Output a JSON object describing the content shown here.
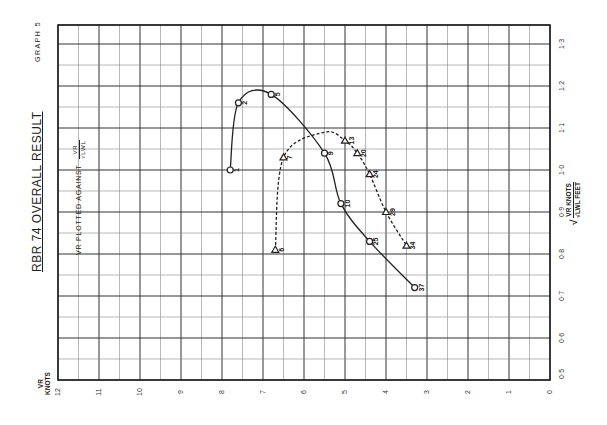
{
  "header": {
    "graph_number": "GRAPH 5",
    "title": "RBR 74  OVERALL RESULT",
    "subtitle_prefix": "VR PLOTTED AGAINST",
    "subtitle_fraction_num": "VR",
    "subtitle_fraction_den": "√LWL"
  },
  "axes": {
    "knots_label_line1": "VR",
    "knots_label_line2": "KNOTS",
    "knots_ticks": [
      "12",
      "11",
      "10",
      "9",
      "8",
      "7",
      "6",
      "5",
      "4",
      "3",
      "2",
      "1",
      "0"
    ],
    "ratio_ticks": [
      "0·5",
      "0·6",
      "0·7",
      "0·8",
      "0·9",
      "1·0",
      "1·1",
      "1·2",
      "1·3"
    ],
    "ratio_label_num": "VR KNOTS",
    "ratio_label_den": "√LWL FEET"
  },
  "chart_data": {
    "type": "line",
    "title": "RBR 74 OVERALL RESULT",
    "subtitle": "VR plotted against VR/√LWL",
    "orientation": "page rotated 90° counter-clockwise",
    "xlabel": "VR KNOTS",
    "ylabel": "VR KNOTS / √LWL FEET",
    "xlim": [
      0,
      12
    ],
    "ylim": [
      0.5,
      1.35
    ],
    "x_ticks": [
      12,
      11,
      10,
      9,
      8,
      7,
      6,
      5,
      4,
      3,
      2,
      1,
      0
    ],
    "y_ticks": [
      0.5,
      0.6,
      0.7,
      0.8,
      0.9,
      1.0,
      1.1,
      1.2,
      1.3
    ],
    "grid": true,
    "series": [
      {
        "name": "Series A (solid, circle markers)",
        "style": "solid",
        "marker": "circle",
        "points": [
          {
            "label": "1",
            "x": 7.8,
            "y": 1.0
          },
          {
            "label": "2",
            "x": 7.6,
            "y": 1.16
          },
          {
            "label": "5",
            "x": 6.8,
            "y": 1.18
          },
          {
            "label": "9",
            "x": 5.5,
            "y": 1.04
          },
          {
            "label": "10",
            "x": 5.1,
            "y": 0.92
          },
          {
            "label": "25",
            "x": 4.4,
            "y": 0.83
          },
          {
            "label": "37",
            "x": 3.3,
            "y": 0.72
          }
        ]
      },
      {
        "name": "Series B (dashed, triangle markers)",
        "style": "dashed",
        "marker": "triangle",
        "points": [
          {
            "label": "6",
            "x": 6.7,
            "y": 0.81
          },
          {
            "label": "7",
            "x": 6.5,
            "y": 1.03
          },
          {
            "label": "13",
            "x": 5.0,
            "y": 1.07
          },
          {
            "label": "20",
            "x": 4.7,
            "y": 1.04
          },
          {
            "label": "24",
            "x": 4.4,
            "y": 0.99
          },
          {
            "label": "29",
            "x": 4.0,
            "y": 0.9
          },
          {
            "label": "34",
            "x": 3.5,
            "y": 0.82
          }
        ]
      }
    ]
  },
  "colors": {
    "ink": "#222222",
    "grid_major": "#333333",
    "grid_minor": "#888888",
    "paper": "#ffffff"
  }
}
